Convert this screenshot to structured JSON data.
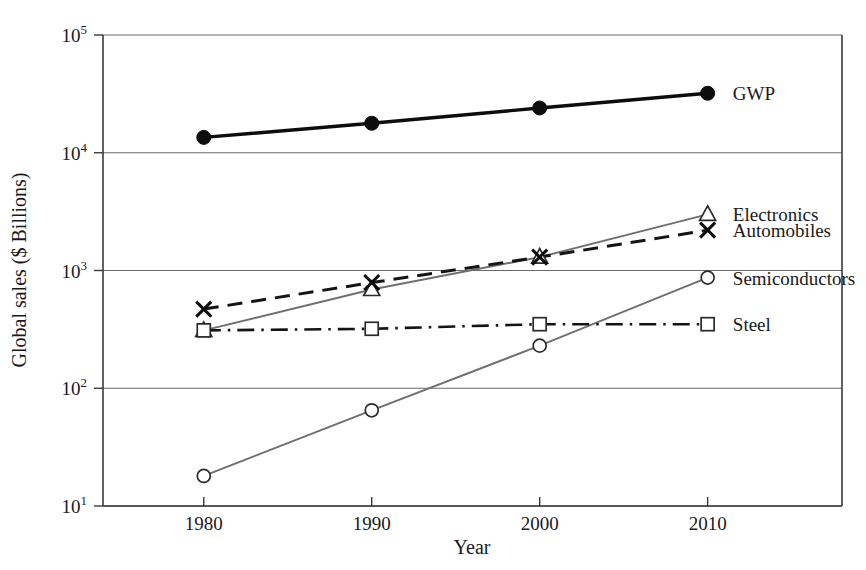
{
  "chart_data": {
    "type": "line",
    "title": "",
    "subtitle": "",
    "xlabel": "Year",
    "ylabel": "Global sales ($ Billions)",
    "x": [
      1980,
      1990,
      2000,
      2010
    ],
    "xtick_labels": [
      "1980",
      "1990",
      "2000",
      "2010"
    ],
    "xlim": [
      1974,
      2018
    ],
    "ylim": [
      10,
      100000
    ],
    "yscale": "log",
    "ytick_values": [
      10,
      100,
      1000,
      10000,
      100000
    ],
    "ytick_labels": [
      "10",
      "10",
      "10",
      "10",
      "10"
    ],
    "ytick_exponents": [
      "1",
      "2",
      "3",
      "4",
      "5"
    ],
    "grid": "horizontal",
    "legend_position": "right-inline",
    "series": [
      {
        "name": "GWP",
        "marker": "filled-circle",
        "linestyle": "solid-thick",
        "color": "#0d0d0d",
        "values": [
          13500,
          17800,
          24000,
          32000
        ],
        "label_x": 2011.5,
        "label_y": 32000
      },
      {
        "name": "Electronics",
        "marker": "open-triangle",
        "linestyle": "solid-thin",
        "color": "#6f6f6f",
        "values": [
          310,
          690,
          1300,
          3000
        ],
        "label_x": 2011.5,
        "label_y": 3000
      },
      {
        "name": "Automobiles",
        "marker": "cross",
        "linestyle": "dashed",
        "color": "#141414",
        "values": [
          470,
          790,
          1300,
          2200
        ],
        "label_x": 2011.5,
        "label_y": 2200
      },
      {
        "name": "Semiconductors",
        "marker": "open-circle",
        "linestyle": "solid-thin",
        "color": "#6f6f6f",
        "values": [
          18,
          65,
          230,
          870
        ],
        "label_x": 2011.5,
        "label_y": 870
      },
      {
        "name": "Steel",
        "marker": "open-square",
        "linestyle": "dash-dot",
        "color": "#141414",
        "values": [
          310,
          320,
          350,
          350
        ],
        "label_x": 2011.5,
        "label_y": 350
      }
    ]
  }
}
